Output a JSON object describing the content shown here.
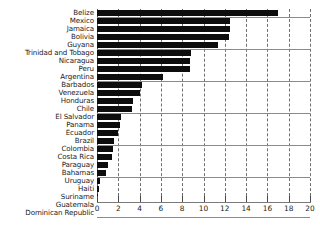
{
  "chart_data": {
    "type": "bar",
    "orientation": "horizontal",
    "title": "",
    "subtitle": "",
    "xlabel": "",
    "ylabel": "",
    "xlim": [
      0,
      20
    ],
    "xticks": [
      0,
      2,
      4,
      6,
      8,
      10,
      12,
      14,
      16,
      18,
      20
    ],
    "xtick_labels": [
      "0",
      "2",
      "4",
      "6",
      "8",
      "10",
      "12",
      "14",
      "16",
      "18",
      "20"
    ],
    "grid": "vertical-dashed",
    "legend": "none",
    "bar_color": "#0d0d0d",
    "grid_color": "#6f6f6f",
    "axis_color": "#7a7a7a",
    "categories": [
      "Belize",
      "Mexico",
      "Jamaica",
      "Bolivia",
      "Guyana",
      "Trinidad and Tobago",
      "Nicaragua",
      "Peru",
      "Argentina",
      "Barbados",
      "Venezuela",
      "Honduras",
      "Chile",
      "El Salvador",
      "Panama",
      "Ecuador",
      "Brazil",
      "Colombia",
      "Costa Rica",
      "Paraguay",
      "Bahamas",
      "Uruguay",
      "Haiti",
      "Suriname",
      "Guatemala",
      "Dominican Republic"
    ],
    "values": [
      17.0,
      12.5,
      12.5,
      12.4,
      11.4,
      8.8,
      8.7,
      8.7,
      6.2,
      4.2,
      4.0,
      3.4,
      3.3,
      2.3,
      2.2,
      2.0,
      1.6,
      1.5,
      1.4,
      1.0,
      0.8,
      0.3,
      0.15,
      0.05,
      0.0,
      0.0
    ]
  }
}
